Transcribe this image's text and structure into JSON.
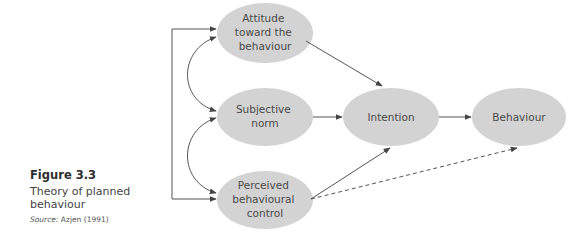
{
  "figure": {
    "number": "Figure 3.3",
    "title": "Theory of planned behaviour",
    "title_line1": "Theory of planned",
    "title_line2": "behaviour",
    "source_label": "Source:",
    "source_text": " Azjen (1991)"
  },
  "nodes": {
    "attitude": {
      "lines": [
        "Attitude",
        "toward the",
        "behaviour"
      ]
    },
    "subjective_norm": {
      "lines": [
        "Subjective",
        "norm"
      ]
    },
    "perceived_control": {
      "lines": [
        "Perceived",
        "behavioural",
        "control"
      ]
    },
    "intention": {
      "lines": [
        "Intention"
      ]
    },
    "behaviour": {
      "lines": [
        "Behaviour"
      ]
    }
  },
  "edges": [
    {
      "from": "attitude",
      "to": "intention",
      "style": "solid"
    },
    {
      "from": "subjective_norm",
      "to": "intention",
      "style": "solid"
    },
    {
      "from": "perceived_control",
      "to": "intention",
      "style": "solid"
    },
    {
      "from": "intention",
      "to": "behaviour",
      "style": "solid"
    },
    {
      "from": "perceived_control",
      "to": "behaviour",
      "style": "dashed"
    },
    {
      "from": "attitude",
      "to": "subjective_norm",
      "style": "curved-bidirectional"
    },
    {
      "from": "subjective_norm",
      "to": "perceived_control",
      "style": "curved-bidirectional"
    },
    {
      "from": "attitude",
      "to": "perceived_control",
      "style": "bracket-bidirectional"
    }
  ],
  "colors": {
    "node_fill": "#d3d3d3",
    "line": "#555555",
    "text": "#4a4a4a"
  }
}
